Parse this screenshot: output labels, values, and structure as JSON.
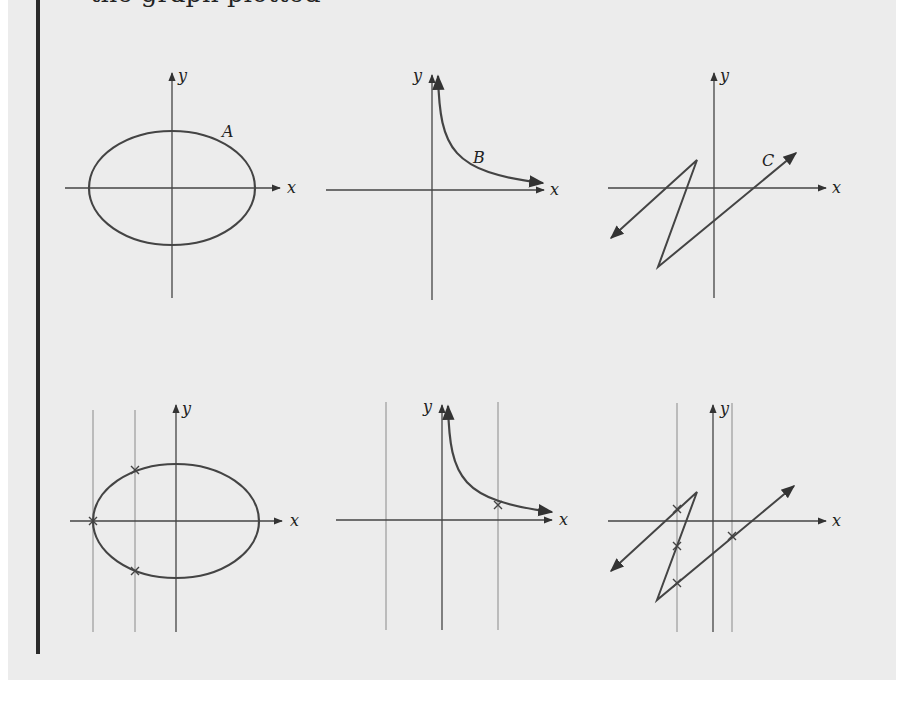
{
  "page": {
    "heading_clipped": "the graph plotted"
  },
  "figure": {
    "stroke_color": "#444444",
    "guide_color": "#8a8a8a",
    "top_row": {
      "graphs": [
        {
          "label": "A",
          "shape": "ellipse",
          "x_axis": "x",
          "y_axis": "y"
        },
        {
          "label": "B",
          "shape": "hyperbola-branch",
          "x_axis": "x",
          "y_axis": "y"
        },
        {
          "label": "C",
          "shape": "z-polyline",
          "x_axis": "x",
          "y_axis": "y"
        }
      ]
    },
    "bottom_row": {
      "graphs": [
        {
          "shape": "ellipse",
          "vertical_lines": 2,
          "intersection_marks": 3,
          "x_axis": "x",
          "y_axis": "y"
        },
        {
          "shape": "hyperbola-branch",
          "vertical_lines": 2,
          "intersection_marks": 1,
          "x_axis": "x",
          "y_axis": "y"
        },
        {
          "shape": "z-polyline",
          "vertical_lines": 2,
          "intersection_marks": 4,
          "x_axis": "x",
          "y_axis": "y"
        }
      ]
    }
  },
  "labels": {
    "a": "A",
    "b": "B",
    "c": "C",
    "x": "x",
    "y": "y"
  }
}
